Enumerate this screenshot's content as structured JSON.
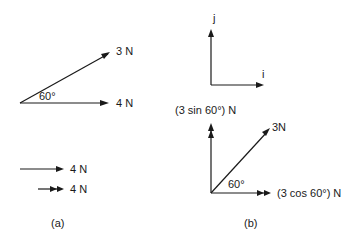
{
  "panel_a": {
    "caption": "(a)",
    "vector_3n_label": "3 N",
    "vector_4n_label": "4 N",
    "angle_label": "60°",
    "legend": [
      {
        "style": "single-arrow",
        "label": "4 N"
      },
      {
        "style": "double-arrow",
        "label": "4 N"
      }
    ]
  },
  "panel_b": {
    "caption": "(b)",
    "unit_vectors": {
      "j_label": "j",
      "i_label": "i"
    },
    "components": {
      "vertical_label": "(3 sin 60°) N",
      "horizontal_label": "(3 cos 60°) N",
      "resultant_label": "3N",
      "angle_label": "60°"
    }
  },
  "colors": {
    "ink": "#1a1a1a",
    "background": "#ffffff"
  }
}
